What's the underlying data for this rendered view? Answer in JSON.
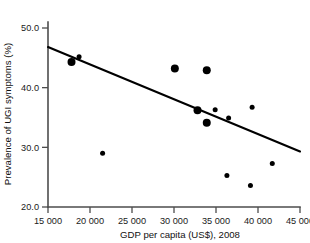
{
  "chart_data": {
    "type": "scatter",
    "title": "",
    "xlabel": "GDP per capita (US$), 2008",
    "ylabel": "Prevalence of UGI symptoms (%)",
    "xlim": [
      15000,
      45000
    ],
    "ylim": [
      20.0,
      50.0
    ],
    "grid": false,
    "legend": "none",
    "xticks": [
      15000,
      20000,
      25000,
      30000,
      35000,
      40000,
      45000
    ],
    "xticklabels": [
      "15 000",
      "20 000",
      "25 000",
      "30 000",
      "35 000",
      "40 000",
      "45 000"
    ],
    "yticks": [
      20.0,
      30.0,
      40.0,
      50.0
    ],
    "yticklabels": [
      "20.0",
      "30.0",
      "40.0",
      "50.0"
    ],
    "point_color": "#000000",
    "line_color": "#000000",
    "axis_color": "#4d4d4d",
    "points": [
      {
        "x": 17800,
        "y": 44.3,
        "size": "large"
      },
      {
        "x": 18700,
        "y": 45.2,
        "size": "small"
      },
      {
        "x": 21500,
        "y": 29.0,
        "size": "small"
      },
      {
        "x": 30100,
        "y": 43.2,
        "size": "large"
      },
      {
        "x": 33900,
        "y": 42.9,
        "size": "large"
      },
      {
        "x": 32800,
        "y": 36.2,
        "size": "large"
      },
      {
        "x": 34900,
        "y": 36.3,
        "size": "small"
      },
      {
        "x": 33900,
        "y": 34.1,
        "size": "large"
      },
      {
        "x": 36500,
        "y": 34.9,
        "size": "small"
      },
      {
        "x": 39300,
        "y": 36.7,
        "size": "small"
      },
      {
        "x": 36300,
        "y": 25.3,
        "size": "small"
      },
      {
        "x": 39100,
        "y": 23.6,
        "size": "small"
      },
      {
        "x": 41700,
        "y": 27.3,
        "size": "small"
      }
    ],
    "trend_line": {
      "x_start": 15000,
      "y_start": 46.8,
      "x_end": 45000,
      "y_end": 29.3
    }
  }
}
